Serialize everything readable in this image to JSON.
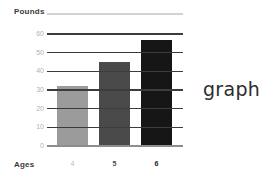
{
  "chart_data": {
    "type": "bar",
    "title": "",
    "ylabel": "Pounds",
    "xlabel": "Ages",
    "categories": [
      "4",
      "5",
      "6"
    ],
    "values": [
      32,
      45,
      57
    ],
    "ylim": [
      0,
      60
    ],
    "yticks": [
      "0",
      "10",
      "20",
      "30",
      "40",
      "50",
      "60"
    ],
    "grid": true,
    "legend": "none",
    "bar_colors": [
      "#9b9b9b",
      "#4a4a4a",
      "#161616"
    ]
  },
  "caption": {
    "text": "graph"
  },
  "colors": {
    "gridline": "#3c3c3c",
    "baseline": "#8d8d8d",
    "top_rule": "#d2d2d2",
    "tick_text": "#b3b3b3",
    "axis_title": "#3a3a3a",
    "background": "#ffffff"
  }
}
